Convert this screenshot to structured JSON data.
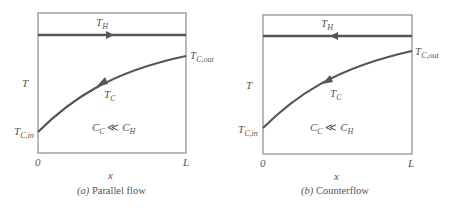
{
  "colors": {
    "axis": "#8a8a8a",
    "hot_line": "#555555",
    "cold_curve": "#555555",
    "text": "#555555"
  },
  "panels": [
    {
      "id": "a",
      "caption_letter": "(a)",
      "caption": "Parallel flow",
      "hot_label": "T",
      "hot_sub": "H",
      "hot_arrow_direction": "right",
      "cold_label": "T",
      "cold_sub": "C",
      "cold_out_label": "T",
      "cold_out_sub": "C,out",
      "cold_in_label": "T",
      "cold_in_sub": "C,in",
      "y_axis_label": "T",
      "x_axis_label": "x",
      "x_start": "0",
      "x_end": "L",
      "condition_left": "C",
      "condition_left_sub": "C",
      "condition_op": "≪",
      "condition_right": "C",
      "condition_right_sub": "H"
    },
    {
      "id": "b",
      "caption_letter": "(b)",
      "caption": "Counterflow",
      "hot_label": "T",
      "hot_sub": "H",
      "hot_arrow_direction": "left",
      "cold_label": "T",
      "cold_sub": "C",
      "cold_out_label": "T",
      "cold_out_sub": "C,out",
      "cold_in_label": "T",
      "cold_in_sub": "C,in",
      "y_axis_label": "T",
      "x_axis_label": "x",
      "x_start": "0",
      "x_end": "L",
      "condition_left": "C",
      "condition_left_sub": "C",
      "condition_op": "≪",
      "condition_right": "C",
      "condition_right_sub": "H"
    }
  ]
}
